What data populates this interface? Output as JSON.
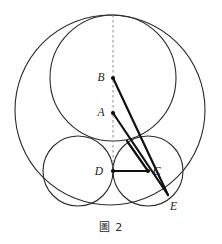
{
  "figure": {
    "caption_mark": "圖",
    "caption_number": "2",
    "caption_full": "圖 2",
    "colors": {
      "stroke": "#2b2b2b",
      "heavy_stroke": "#111111",
      "dashed": "#8c8c8c",
      "background": "#ffffff",
      "label": "#1a1a1a"
    }
  },
  "geometry": {
    "type": "euclidean-circle-packing",
    "viewbox": "0 0 222 244",
    "circles": [
      {
        "name": "outer-circle",
        "cx": 110,
        "cy": 110,
        "r": 95,
        "stroke_width": 1.1,
        "filled": false
      },
      {
        "name": "large-inner-circle",
        "cx": 113,
        "cy": 78,
        "r": 63,
        "stroke_width": 1.1,
        "filled": false
      },
      {
        "name": "small-circle-left",
        "cx": 78,
        "cy": 171,
        "r": 35,
        "stroke_width": 1.1,
        "filled": false
      },
      {
        "name": "small-circle-right",
        "cx": 148,
        "cy": 171,
        "r": 35,
        "stroke_width": 1.1,
        "filled": false
      }
    ],
    "points": [
      {
        "name": "A",
        "label": "A",
        "x": 113,
        "y": 113,
        "label_x": 101,
        "label_y": 116,
        "dot": true
      },
      {
        "name": "B",
        "label": "B",
        "x": 113,
        "y": 78,
        "label_x": 101,
        "label_y": 81,
        "dot": true
      },
      {
        "name": "C",
        "label": "C",
        "x": 148,
        "y": 171,
        "label_x": 153,
        "label_y": 175,
        "dot": true
      },
      {
        "name": "D",
        "label": "D",
        "x": 113,
        "y": 171,
        "label_x": 99,
        "label_y": 175,
        "dot": true
      },
      {
        "name": "E",
        "label": "E",
        "x": 168,
        "y": 195,
        "label_x": 170,
        "label_y": 210,
        "dot": false
      }
    ],
    "segments": [
      {
        "name": "segment-BE",
        "x1": 113,
        "y1": 78,
        "x2": 168,
        "y2": 195,
        "stroke_width": 2.2
      },
      {
        "name": "segment-AE",
        "x1": 113,
        "y1": 113,
        "x2": 168,
        "y2": 195,
        "stroke_width": 2.2
      },
      {
        "name": "segment-DC",
        "x1": 113,
        "y1": 171,
        "x2": 148,
        "y2": 171,
        "stroke_width": 2.2
      },
      {
        "name": "segment-CB-upper",
        "x1": 148,
        "y1": 171,
        "x2": 127,
        "y2": 141,
        "stroke_width": 2.2
      }
    ],
    "dashed_lines": [
      {
        "name": "axis-of-symmetry",
        "x1": 113,
        "y1": 15,
        "x2": 113,
        "y2": 175,
        "dash_pattern": "2.5 2.5",
        "stroke_width": 1
      }
    ]
  }
}
